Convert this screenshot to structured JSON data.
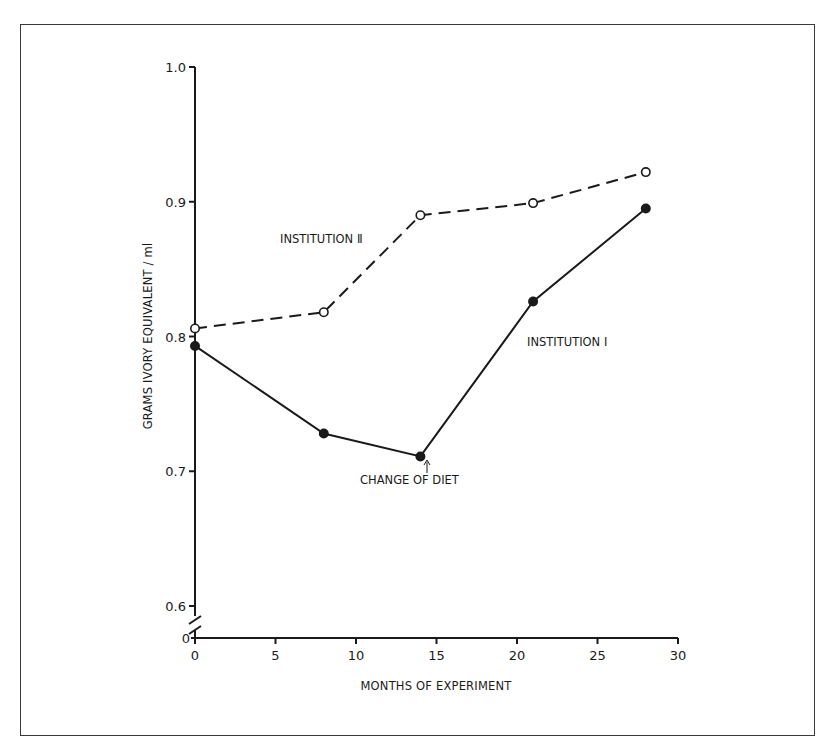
{
  "chart_data": {
    "type": "line",
    "title": "",
    "xlabel": "MONTHS OF EXPERIMENT",
    "ylabel": "GRAMS IVORY EQUIVALENT / ml",
    "xlim": [
      0,
      30
    ],
    "ylim": [
      0.6,
      1.0
    ],
    "y_axis_break": true,
    "y_break_lower_label": "0",
    "x_ticks": [
      "0",
      "5",
      "10",
      "15",
      "20",
      "25",
      "30"
    ],
    "y_ticks": [
      "0.6",
      "0.7",
      "0.8",
      "0.9",
      "1.0"
    ],
    "grid": false,
    "legend": "inline labels",
    "series": [
      {
        "name": "INSTITUTION II",
        "style": "dashed",
        "marker": "open-circle",
        "x": [
          0,
          8,
          14,
          21,
          28
        ],
        "values": [
          0.806,
          0.818,
          0.89,
          0.899,
          0.922
        ]
      },
      {
        "name": "INSTITUTION I",
        "style": "solid",
        "marker": "filled-circle",
        "x": [
          0,
          8,
          14,
          21,
          28
        ],
        "values": [
          0.793,
          0.728,
          0.711,
          0.826,
          0.895
        ]
      }
    ],
    "annotations": [
      {
        "text": "CHANGE OF DIET",
        "x": 14,
        "arrow": true
      }
    ]
  },
  "labels": {
    "series_a": "INSTITUTION Ⅱ",
    "series_b": "INSTITUTION Ⅰ",
    "change": "CHANGE OF DIET",
    "xlabel": "MONTHS OF EXPERIMENT",
    "ylabel": "GRAMS IVORY EQUIVALENT / ml",
    "break_zero": "0"
  }
}
